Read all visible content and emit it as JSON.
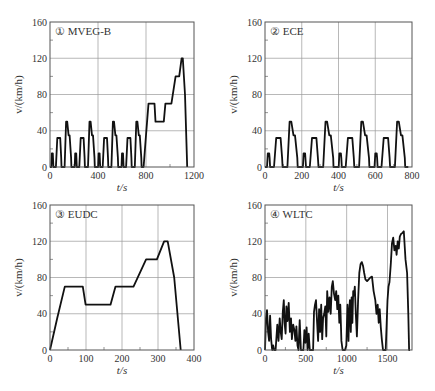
{
  "figure": {
    "panels_layout": "2x2"
  },
  "chart_data": [
    {
      "type": "line",
      "id": "mveg-b",
      "title": "① MVEG-B",
      "xlabel": "t/s",
      "ylabel": "v/(km/h)",
      "xlim": [
        0,
        1200
      ],
      "ylim": [
        0,
        160
      ],
      "xticks": [
        0,
        400,
        800,
        1200
      ],
      "yticks": [
        0,
        40,
        80,
        120,
        160
      ],
      "grid": true,
      "box": {
        "left": 50,
        "top": 22,
        "right": 194,
        "bottom": 167
      },
      "x": [],
      "y": [],
      "composition": "4 x ECE urban cycle (0-780 s) followed by EUDC (780-1180 s)"
    },
    {
      "type": "line",
      "id": "ece",
      "title": "② ECE",
      "xlabel": "t/s",
      "ylabel": "v/(km/h)",
      "xlim": [
        0,
        800
      ],
      "ylim": [
        0,
        160
      ],
      "xticks": [
        0,
        200,
        400,
        600,
        800
      ],
      "yticks": [
        0,
        40,
        80,
        120,
        160
      ],
      "grid": true,
      "box": {
        "left": 265,
        "top": 22,
        "right": 412,
        "bottom": 167
      },
      "x": [],
      "y": [],
      "composition": "4 x ECE urban cycle, 195 s each"
    },
    {
      "type": "line",
      "id": "eudc",
      "title": "③ EUDC",
      "xlabel": "t/s",
      "ylabel": "v/(km/h)",
      "xlim": [
        0,
        400
      ],
      "ylim": [
        0,
        160
      ],
      "xticks": [
        0,
        100,
        200,
        300,
        400
      ],
      "yticks": [
        0,
        40,
        80,
        120,
        160
      ],
      "grid": true,
      "box": {
        "left": 50,
        "top": 205,
        "right": 194,
        "bottom": 350
      },
      "x": [
        0,
        20,
        41,
        91,
        99,
        168,
        182,
        232,
        267,
        297,
        317,
        327,
        345,
        363
      ],
      "y": [
        0,
        35,
        70,
        70,
        50,
        50,
        70,
        70,
        100,
        100,
        120,
        120,
        80,
        0
      ]
    },
    {
      "type": "line",
      "id": "wltc",
      "title": "④ WLTC",
      "xlabel": "t/s",
      "ylabel": "v/(km/h)",
      "xlim": [
        0,
        1800
      ],
      "ylim": [
        0,
        160
      ],
      "xticks": [
        0,
        500,
        1000,
        1500
      ],
      "yticks": [
        0,
        40,
        80,
        120,
        160
      ],
      "grid": true,
      "box": {
        "left": 265,
        "top": 205,
        "right": 412,
        "bottom": 350
      },
      "x": [
        0,
        12,
        25,
        38,
        50,
        62,
        75,
        88,
        100,
        112,
        130,
        150,
        165,
        180,
        192,
        205,
        218,
        230,
        240,
        252,
        262,
        275,
        290,
        305,
        318,
        330,
        345,
        360,
        372,
        385,
        398,
        410,
        425,
        440,
        458,
        470,
        482,
        495,
        510,
        522,
        535,
        548,
        560,
        575,
        589,
        600,
        612,
        625,
        638,
        650,
        662,
        675,
        688,
        700,
        712,
        725,
        738,
        750,
        762,
        775,
        790,
        805,
        818,
        830,
        845,
        860,
        872,
        885,
        898,
        910,
        922,
        935,
        950,
        965,
        980,
        995,
        1010,
        1022,
        1030,
        1040,
        1050,
        1060,
        1070,
        1080,
        1090,
        1100,
        1112,
        1125,
        1140,
        1155,
        1170,
        1185,
        1200,
        1215,
        1230,
        1250,
        1270,
        1290,
        1310,
        1330,
        1350,
        1365,
        1380,
        1392,
        1405,
        1418,
        1430,
        1445,
        1460,
        1478,
        1490,
        1500,
        1512,
        1525,
        1540,
        1555,
        1570,
        1585,
        1600,
        1612,
        1625,
        1638,
        1650,
        1665,
        1680,
        1700,
        1720,
        1740,
        1755,
        1765,
        1775,
        1790,
        1800
      ],
      "y": [
        0,
        35,
        44,
        20,
        10,
        38,
        12,
        0,
        5,
        0,
        0,
        28,
        10,
        35,
        20,
        12,
        42,
        55,
        30,
        18,
        48,
        32,
        52,
        20,
        35,
        12,
        28,
        22,
        10,
        26,
        5,
        0,
        33,
        0,
        0,
        0,
        22,
        8,
        25,
        0,
        18,
        0,
        0,
        0,
        0,
        42,
        50,
        55,
        30,
        10,
        45,
        20,
        50,
        12,
        35,
        40,
        48,
        15,
        65,
        42,
        58,
        40,
        70,
        76,
        62,
        55,
        65,
        45,
        60,
        30,
        50,
        10,
        0,
        0,
        0,
        5,
        50,
        10,
        40,
        55,
        20,
        58,
        30,
        65,
        60,
        70,
        40,
        15,
        55,
        85,
        95,
        97,
        93,
        85,
        78,
        76,
        78,
        80,
        81,
        65,
        55,
        40,
        50,
        30,
        45,
        25,
        12,
        0,
        0,
        0,
        30,
        55,
        70,
        75,
        95,
        118,
        124,
        110,
        115,
        105,
        120,
        112,
        125,
        128,
        129,
        131,
        100,
        85,
        40,
        0,
        0
      ],
      "note": "WLTC class 3 profile; values approximate, read from figure"
    }
  ]
}
